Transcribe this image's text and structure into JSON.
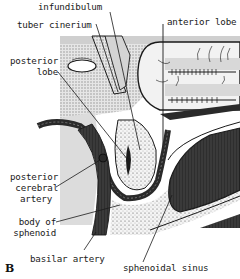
{
  "figure": {
    "panel_letter": "B",
    "colors": {
      "background": "#ffffff",
      "stipple_gray": "#c8c8c8",
      "light_gray": "#e2e2e2",
      "dark_fill": "#3a3a3a",
      "line": "#1a1a1a"
    },
    "labels": {
      "infundibulum": "infundibulum",
      "tuber_cinerium": "tuber cinerium",
      "anterior_lobe": "anterior lobe",
      "posterior_lobe_1": "posterior",
      "posterior_lobe_2": "lobe",
      "posterior_cerebral_artery_1": "posterior",
      "posterior_cerebral_artery_2": "cerebral",
      "posterior_cerebral_artery_3": "artery",
      "body_of_sphenoid_1": "body of",
      "body_of_sphenoid_2": "sphenoid",
      "basilar_artery": "basilar artery",
      "sphenoidal_sinus": "sphenoidal sinus"
    }
  }
}
